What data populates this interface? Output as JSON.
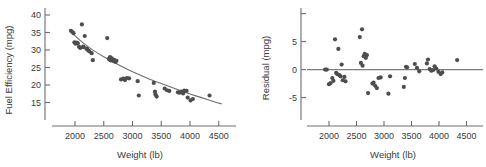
{
  "figure": {
    "title": "",
    "panels": [
      "fuel-efficiency-vs-weight",
      "residual-vs-weight"
    ]
  },
  "chart_data": [
    {
      "type": "scatter",
      "name": "fuel-efficiency-vs-weight",
      "title": "",
      "xlabel": "Weight (lb)",
      "ylabel": "Fuel Efficiency (mpg)",
      "xlim": [
        1600,
        4800
      ],
      "ylim": [
        10,
        42
      ],
      "xticks": [
        2000,
        2500,
        3000,
        3500,
        4000,
        4500
      ],
      "yticks": [
        15,
        20,
        25,
        30,
        35,
        40
      ],
      "xticklabels": [
        "2000",
        "2500",
        "3000",
        "3500",
        "4000",
        "4500"
      ],
      "yticklabels": [
        "15",
        "20",
        "25",
        "30",
        "35",
        "40"
      ],
      "grid": false,
      "legend": "none",
      "marker_color": "#4d4d4d",
      "line_color": "#6e6e6e",
      "x": [
        1930,
        1950,
        1975,
        1990,
        2005,
        2010,
        2030,
        2050,
        2070,
        2090,
        2120,
        2140,
        2150,
        2170,
        2200,
        2210,
        2230,
        2250,
        2290,
        2310,
        2560,
        2590,
        2600,
        2610,
        2620,
        2640,
        2660,
        2680,
        2700,
        2720,
        2800,
        2840,
        2870,
        2900,
        2940,
        3090,
        3110,
        3370,
        3390,
        3400,
        3420,
        3560,
        3600,
        3640,
        3790,
        3820,
        3850,
        3880,
        3900,
        3940,
        3960,
        4010,
        4050,
        4340
      ],
      "y": [
        35.5,
        35.2,
        34.8,
        32.2,
        32.0,
        31.8,
        32.1,
        31.9,
        30.9,
        30.6,
        37.3,
        31.0,
        30.8,
        34.0,
        30.4,
        30.2,
        29.9,
        29.6,
        29.1,
        27.1,
        33.4,
        27.5,
        27.3,
        28.0,
        27.0,
        27.6,
        26.9,
        27.2,
        26.6,
        26.9,
        21.6,
        21.8,
        21.4,
        22.0,
        21.9,
        21.1,
        17.0,
        20.6,
        18.1,
        17.3,
        16.7,
        19.0,
        18.5,
        18.3,
        17.9,
        17.8,
        18.1,
        17.6,
        18.4,
        18.3,
        16.4,
        15.6,
        16.0,
        17.0
      ],
      "fit_curve": {
        "label": "smoothed fit",
        "x": [
          1900,
          2000,
          2200,
          2400,
          2600,
          2800,
          3000,
          3200,
          3400,
          3600,
          3800,
          4000,
          4200,
          4400,
          4550
        ],
        "y": [
          35.8,
          34.0,
          31.2,
          29.0,
          27.2,
          25.4,
          23.8,
          22.3,
          21.0,
          19.8,
          18.6,
          17.4,
          16.4,
          15.3,
          14.6
        ]
      }
    },
    {
      "type": "scatter",
      "name": "residual-vs-weight",
      "title": "",
      "xlabel": "Weight (lb)",
      "ylabel": "Residual (mpg)",
      "xlim": [
        1600,
        4800
      ],
      "ylim": [
        -9,
        11
      ],
      "xticks": [
        2000,
        2500,
        3000,
        3500,
        4000,
        4500
      ],
      "yticks": [
        -5,
        0,
        5,
        10
      ],
      "xticklabels": [
        "2000",
        "2500",
        "3000",
        "3500",
        "4000",
        "4500"
      ],
      "yticklabels": [
        "-5",
        "0",
        "5",
        ""
      ],
      "grid": false,
      "legend": "none",
      "marker_color": "#4d4d4d",
      "line_color": "#7d7d7d",
      "reference_line_y": 0,
      "x": [
        1930,
        1960,
        2000,
        2030,
        2060,
        2080,
        2110,
        2130,
        2150,
        2170,
        2190,
        2210,
        2230,
        2250,
        2280,
        2300,
        2560,
        2580,
        2600,
        2610,
        2630,
        2650,
        2670,
        2690,
        2710,
        2790,
        2810,
        2840,
        2870,
        2900,
        2940,
        3080,
        3110,
        3360,
        3380,
        3400,
        3420,
        3560,
        3600,
        3640,
        3780,
        3800,
        3830,
        3860,
        3890,
        3920,
        3950,
        3990,
        4030,
        4060,
        4330
      ],
      "y": [
        0.0,
        0.0,
        -2.6,
        -2.4,
        -1.5,
        -2.0,
        5.4,
        -0.6,
        -0.8,
        3.7,
        -1.0,
        -1.2,
        0.9,
        -1.9,
        -1.3,
        -2.1,
        5.8,
        1.2,
        7.2,
        0.7,
        2.4,
        2.8,
        2.1,
        2.6,
        -4.2,
        -2.5,
        -2.3,
        -2.9,
        -3.3,
        -1.5,
        -1.4,
        -4.3,
        -1.2,
        -3.1,
        -1.5,
        0.5,
        0.4,
        1.0,
        0.3,
        -0.3,
        1.1,
        1.8,
        0.1,
        -0.2,
        -0.1,
        0.6,
        0.2,
        -0.4,
        -0.8,
        -0.5,
        1.7
      ]
    }
  ]
}
